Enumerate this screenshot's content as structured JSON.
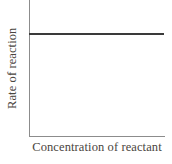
{
  "chart_data": {
    "type": "line",
    "title": "",
    "subtitle": "",
    "xlabel": "Concentration of reactant",
    "ylabel": "Rate of reaction",
    "x": [
      0,
      1
    ],
    "series": [
      {
        "name": "Rate",
        "values": [
          0.76,
          0.76
        ],
        "color": "#3a3a3a"
      }
    ],
    "xlim": [
      0,
      1
    ],
    "ylim": [
      0,
      1
    ],
    "xticks": [],
    "yticks": [],
    "xticklabels": [],
    "yticklabels": [],
    "grid": false,
    "legend": false,
    "legend_position": "none",
    "annotations": [],
    "axis_color": "#8c8c8c",
    "label_color": "#4a4540",
    "background_color": "#ffffff"
  },
  "figure": {
    "y_axis_title": "Rate of reaction",
    "x_axis_title": "Concentration of reactant"
  }
}
